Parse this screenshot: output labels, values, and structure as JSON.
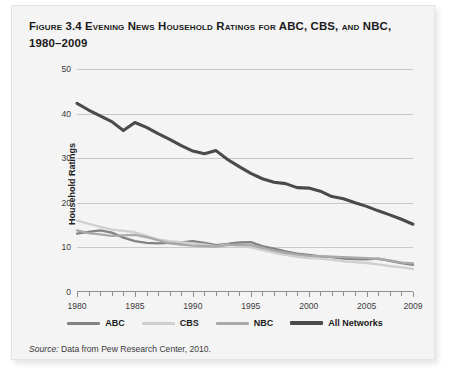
{
  "figure": {
    "title": "Figure 3.4 Evening News Household Ratings for ABC, CBS, and NBC, 1980–2009",
    "source_lead": "Source:",
    "source_text": " Data from Pew Research Center, 2010."
  },
  "colors": {
    "panel_background": "#f4f4f4",
    "gridline": "#c9c9c9",
    "axis": "#8e8e8e",
    "abc": "#828282",
    "cbs": "#cfcfcf",
    "nbc": "#a9a9a9",
    "all_networks": "#4a4a4a",
    "text": "#1b1b1b"
  },
  "legend": {
    "position": "bottom",
    "items": [
      {
        "label": "ABC",
        "color": "#828282"
      },
      {
        "label": "CBS",
        "color": "#cfcfcf"
      },
      {
        "label": "NBC",
        "color": "#a9a9a9"
      },
      {
        "label": "All Networks",
        "color": "#4a4a4a"
      }
    ]
  },
  "chart_data": {
    "type": "line",
    "title": "Figure 3.4 Evening News Household Ratings for ABC, CBS, and NBC, 1980–2009",
    "xlabel": "",
    "ylabel": "Household Ratings",
    "xlim": [
      1980,
      2009
    ],
    "ylim": [
      0,
      50
    ],
    "yticks": [
      0,
      10,
      20,
      30,
      40,
      50
    ],
    "ytick_labels": [
      "0",
      "10",
      "20",
      "30",
      "40",
      "50"
    ],
    "xticks": [
      1980,
      1981,
      1982,
      1983,
      1984,
      1985,
      1986,
      1987,
      1988,
      1989,
      1990,
      1991,
      1992,
      1993,
      1994,
      1995,
      1996,
      1997,
      1998,
      1999,
      2000,
      2001,
      2002,
      2003,
      2004,
      2005,
      2006,
      2007,
      2008,
      2009
    ],
    "xtick_labels_shown": [
      "1980",
      "1985",
      "1990",
      "1995",
      "2000",
      "2005",
      "2009"
    ],
    "grid": "horizontal",
    "legend_position": "bottom",
    "x": [
      1980,
      1981,
      1982,
      1983,
      1984,
      1985,
      1986,
      1987,
      1988,
      1989,
      1990,
      1991,
      1992,
      1993,
      1994,
      1995,
      1996,
      1997,
      1998,
      1999,
      2000,
      2001,
      2002,
      2003,
      2004,
      2005,
      2006,
      2007,
      2008,
      2009
    ],
    "series": [
      {
        "name": "ABC",
        "color": "#828282",
        "values": [
          13.1,
          13.5,
          13.8,
          13.3,
          12.2,
          11.4,
          11.0,
          10.9,
          11.0,
          11.1,
          11.4,
          11.0,
          10.5,
          10.8,
          11.1,
          11.2,
          10.3,
          9.7,
          9.1,
          8.6,
          8.3,
          8.0,
          7.8,
          7.5,
          7.4,
          7.3,
          7.5,
          7.0,
          6.5,
          6.1
        ]
      },
      {
        "name": "CBS",
        "color": "#cfcfcf",
        "values": [
          16.0,
          15.3,
          14.6,
          14.0,
          13.7,
          13.4,
          12.6,
          11.8,
          11.4,
          11.2,
          10.9,
          10.6,
          10.3,
          10.6,
          10.3,
          10.0,
          9.4,
          8.8,
          8.3,
          7.9,
          7.6,
          7.5,
          7.2,
          6.9,
          6.7,
          6.5,
          6.2,
          5.8,
          5.5,
          5.2
        ]
      },
      {
        "name": "NBC",
        "color": "#a9a9a9",
        "values": [
          13.8,
          13.2,
          12.9,
          12.6,
          12.7,
          12.8,
          12.3,
          11.6,
          10.9,
          10.6,
          10.4,
          10.3,
          10.2,
          10.5,
          10.6,
          10.5,
          9.9,
          9.3,
          8.8,
          8.4,
          8.1,
          8.0,
          7.9,
          7.8,
          7.7,
          7.6,
          7.4,
          7.1,
          6.6,
          6.4
        ]
      },
      {
        "name": "All Networks",
        "color": "#4a4a4a",
        "values": [
          42.3,
          40.8,
          39.5,
          38.2,
          36.2,
          38.0,
          36.9,
          35.5,
          34.2,
          32.8,
          31.6,
          31.0,
          31.7,
          29.7,
          28.1,
          26.6,
          25.4,
          24.6,
          24.3,
          23.4,
          23.3,
          22.6,
          21.4,
          20.9,
          20.0,
          19.2,
          18.2,
          17.3,
          16.3,
          15.2
        ]
      }
    ]
  }
}
